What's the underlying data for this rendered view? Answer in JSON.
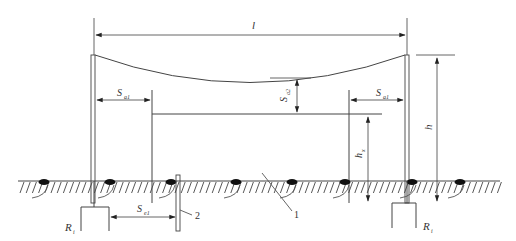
{
  "diagram": {
    "type": "lightning-protection-overhead-wire-schematic",
    "labels": {
      "span": "l",
      "height": "h",
      "protected_height": "h",
      "protected_height_sub": "x",
      "air_distance_left": "S",
      "air_distance_left_sub": "a1",
      "air_distance_right": "S",
      "air_distance_right_sub": "a1",
      "sag_distance": "S",
      "sag_distance_sub": "a2",
      "earth_distance": "S",
      "earth_distance_sub": "e1",
      "ground_resistance_left": "R",
      "ground_resistance_left_sub": "i",
      "ground_resistance_right": "R",
      "ground_resistance_right_sub": "i"
    },
    "callouts": [
      {
        "number": "1",
        "target": "ground-hatching"
      },
      {
        "number": "2",
        "target": "grounding-rod"
      }
    ],
    "colors": {
      "line": "#444444",
      "background": "#ffffff",
      "blob": "#111111"
    }
  }
}
